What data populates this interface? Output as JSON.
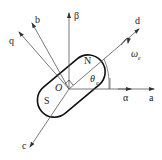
{
  "diagram": {
    "labels": {
      "a": "a",
      "b": "b",
      "c": "c",
      "alpha": "α",
      "beta": "β",
      "d": "d",
      "q": "q",
      "N": "N",
      "S": "S",
      "O": "O",
      "theta": "θ",
      "theta_sub": "e",
      "omega": "ω",
      "omega_sub": "e"
    },
    "colors": {
      "line": "#555555",
      "outline": "#111111",
      "text": "#222222"
    }
  }
}
